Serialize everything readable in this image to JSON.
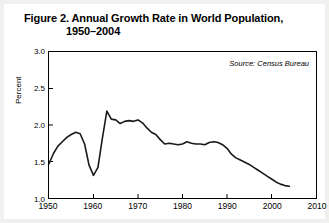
{
  "figure": {
    "title_line_1": "Figure 2. Annual Growth Rate in World Population,",
    "title_line_2": "1950–2004",
    "source_note": "Source: Census Bureau"
  },
  "chart_data": {
    "type": "line",
    "title": "Figure 2. Annual Growth Rate in World Population, 1950–2004",
    "subtitle": "",
    "source": "Source: Census Bureau",
    "xlabel": "",
    "ylabel": "Percent",
    "xlim": [
      1950,
      2010
    ],
    "ylim": [
      1.0,
      3.0
    ],
    "grid": false,
    "legend": false,
    "line_color": "#1a1a1a",
    "xticks": [
      1950,
      1960,
      1970,
      1980,
      1990,
      2000,
      2010
    ],
    "xtick_labels": [
      "1950",
      "1960",
      "1970",
      "1980",
      "1990",
      "2000",
      "2010"
    ],
    "yticks": [
      1.0,
      1.5,
      2.0,
      2.5,
      3.0
    ],
    "ytick_labels": [
      "1.0",
      "1.5",
      "2.0",
      "2.5",
      "3.0"
    ],
    "series": [
      {
        "name": "Annual growth rate of world population",
        "x": [
          1950,
          1951,
          1952,
          1953,
          1954,
          1955,
          1956,
          1957,
          1958,
          1959,
          1960,
          1961,
          1962,
          1963,
          1964,
          1965,
          1966,
          1967,
          1968,
          1969,
          1970,
          1971,
          1972,
          1973,
          1974,
          1975,
          1976,
          1977,
          1978,
          1979,
          1980,
          1981,
          1982,
          1983,
          1984,
          1985,
          1986,
          1987,
          1988,
          1989,
          1990,
          1991,
          1992,
          1993,
          1994,
          1995,
          1996,
          1997,
          1998,
          1999,
          2000,
          2001,
          2002,
          2003,
          2004
        ],
        "values": [
          1.47,
          1.61,
          1.71,
          1.77,
          1.83,
          1.87,
          1.9,
          1.88,
          1.74,
          1.45,
          1.31,
          1.42,
          1.82,
          2.19,
          2.08,
          2.07,
          2.02,
          2.05,
          2.06,
          2.05,
          2.07,
          2.03,
          1.96,
          1.9,
          1.87,
          1.8,
          1.74,
          1.75,
          1.74,
          1.73,
          1.74,
          1.77,
          1.75,
          1.74,
          1.74,
          1.73,
          1.76,
          1.77,
          1.76,
          1.73,
          1.68,
          1.6,
          1.55,
          1.52,
          1.49,
          1.46,
          1.42,
          1.38,
          1.34,
          1.3,
          1.26,
          1.22,
          1.19,
          1.17,
          1.16
        ]
      }
    ],
    "annotations": [
      {
        "text": "Source: Census Bureau",
        "position": "top-right-inside-plot"
      }
    ]
  }
}
